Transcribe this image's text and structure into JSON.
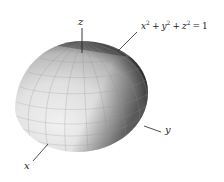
{
  "diagram": {
    "surface": "hemisphere",
    "equation": {
      "text": "x^2 + y^2 + z^2 = 1",
      "terms": [
        {
          "var": "x",
          "exp": "2"
        },
        {
          "var": "y",
          "exp": "2"
        },
        {
          "var": "z",
          "exp": "2"
        }
      ],
      "op": "+",
      "eq": "=",
      "rhs": "1"
    },
    "axes": {
      "x": {
        "label": "x"
      },
      "y": {
        "label": "y"
      },
      "z": {
        "label": "z"
      }
    },
    "colors": {
      "background": "#ffffff",
      "surface_light": "#f4f4f4",
      "surface_mid": "#c8c8c8",
      "surface_dark": "#3a3a3a",
      "grid": "#9a9a9a",
      "axis": "#222222"
    }
  }
}
